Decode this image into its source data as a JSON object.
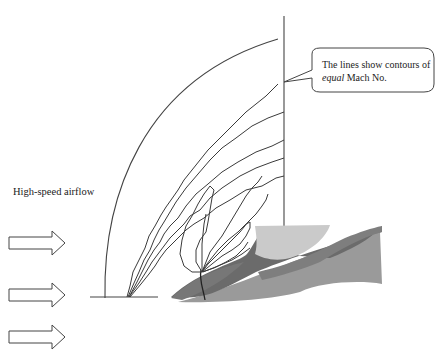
{
  "diagram": {
    "type": "aerodynamics-illustration",
    "labels": {
      "airflow": "High-speed airflow",
      "callout_line1_prefix": "The lines show contours of",
      "callout_emphasis": "equal",
      "callout_suffix": " Mach No."
    },
    "elements": {
      "arrows": [
        {
          "id": "arrow-1",
          "direction": "right",
          "y": 243
        },
        {
          "id": "arrow-2",
          "direction": "right",
          "y": 295
        },
        {
          "id": "arrow-3",
          "direction": "right",
          "y": 337
        }
      ],
      "shock_boundary": "curved arc from ground line up to top vertical line",
      "reference_vertical_line": "vertical line at right of contour region",
      "contour_lines": "multiple jagged lines radiating from the nose tip",
      "body_shapes": [
        "aircraft nose (dark grey)",
        "canopy (light grey)",
        "fuselage side (mid grey)"
      ]
    },
    "colors": {
      "line": "#3a3a3a",
      "nose_dark": "#6b6b6b",
      "canopy_light": "#c9c9c9",
      "fuselage_mid": "#9a9a9a",
      "background": "#ffffff"
    }
  }
}
